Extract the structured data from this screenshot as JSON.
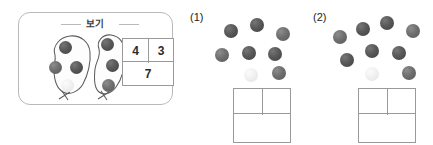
{
  "example": {
    "label": "보기",
    "groups": [
      {
        "name": "left-blob",
        "count": 4
      },
      {
        "name": "right-blob",
        "count": 3
      }
    ],
    "bond_table": {
      "top_left": "4",
      "top_right": "3",
      "bottom": "7"
    },
    "dots": [
      {
        "id": "left-1",
        "shade": "dark",
        "x": 16,
        "y": 8,
        "d": 13
      },
      {
        "id": "left-2",
        "shade": "mid",
        "x": 6,
        "y": 28,
        "d": 13
      },
      {
        "id": "left-3",
        "shade": "dark",
        "x": 27,
        "y": 28,
        "d": 13
      },
      {
        "id": "left-4",
        "shade": "light",
        "x": 18,
        "y": 46,
        "d": 13
      },
      {
        "id": "right-1",
        "shade": "dark",
        "x": 58,
        "y": 5,
        "d": 13
      },
      {
        "id": "right-2",
        "shade": "dark",
        "x": 63,
        "y": 26,
        "d": 13
      },
      {
        "id": "right-3",
        "shade": "mid",
        "x": 59,
        "y": 46,
        "d": 13
      }
    ]
  },
  "questions": [
    {
      "label": "(1)",
      "dot_count": 8,
      "dots": [
        {
          "id": "q1-1",
          "shade": "dark",
          "x": 14,
          "y": 10,
          "d": 14
        },
        {
          "id": "q1-2",
          "shade": "dark",
          "x": 40,
          "y": 4,
          "d": 14
        },
        {
          "id": "q1-3",
          "shade": "mid",
          "x": 66,
          "y": 13,
          "d": 14
        },
        {
          "id": "q1-4",
          "shade": "mid",
          "x": 5,
          "y": 34,
          "d": 14
        },
        {
          "id": "q1-5",
          "shade": "dark",
          "x": 32,
          "y": 32,
          "d": 14
        },
        {
          "id": "q1-6",
          "shade": "dark",
          "x": 58,
          "y": 33,
          "d": 14
        },
        {
          "id": "q1-7",
          "shade": "light",
          "x": 34,
          "y": 54,
          "d": 14
        },
        {
          "id": "q1-8",
          "shade": "mid",
          "x": 62,
          "y": 52,
          "d": 14
        }
      ],
      "bond_table": {
        "top_left": "",
        "top_right": "",
        "bottom": ""
      }
    },
    {
      "label": "(2)",
      "dot_count": 9,
      "dots": [
        {
          "id": "q2-1",
          "shade": "mid",
          "x": 3,
          "y": 16,
          "d": 14
        },
        {
          "id": "q2-2",
          "shade": "dark",
          "x": 26,
          "y": 8,
          "d": 14
        },
        {
          "id": "q2-3",
          "shade": "dark",
          "x": 50,
          "y": 2,
          "d": 14
        },
        {
          "id": "q2-4",
          "shade": "mid",
          "x": 76,
          "y": 10,
          "d": 14
        },
        {
          "id": "q2-5",
          "shade": "dark",
          "x": 35,
          "y": 30,
          "d": 14
        },
        {
          "id": "q2-6",
          "shade": "dark",
          "x": 62,
          "y": 32,
          "d": 14
        },
        {
          "id": "q2-7",
          "shade": "dark",
          "x": 10,
          "y": 39,
          "d": 14
        },
        {
          "id": "q2-8",
          "shade": "light",
          "x": 35,
          "y": 53,
          "d": 14
        },
        {
          "id": "q2-9",
          "shade": "mid",
          "x": 72,
          "y": 52,
          "d": 14
        }
      ],
      "bond_table": {
        "top_left": "",
        "top_right": "",
        "bottom": ""
      }
    }
  ],
  "colors": {
    "box_border": "#b9b9b9",
    "table_border": "#9a9a9a",
    "blob_stroke": "#5d5d5d",
    "text": "#2b2b2b"
  }
}
